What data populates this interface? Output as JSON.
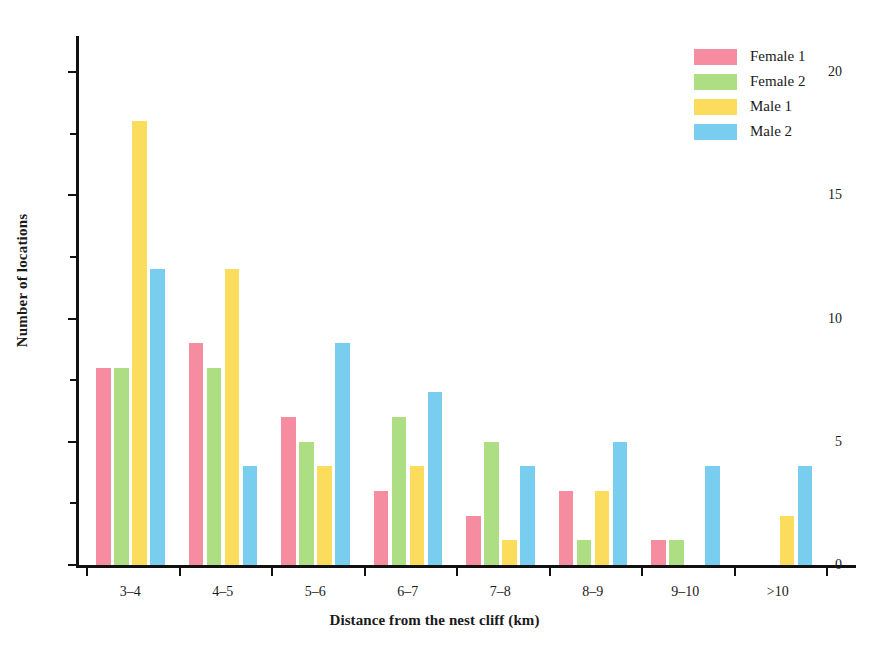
{
  "chart_data": {
    "type": "bar",
    "title": "",
    "xlabel": "Distance from the nest cliff (km)",
    "ylabel": "Number of locations",
    "categories": [
      "3–4",
      "4–5",
      "5–6",
      "6–7",
      "7–8",
      "8–9",
      "9–10",
      ">10"
    ],
    "series": [
      {
        "name": "Female 1",
        "color": "#f58ca0",
        "values": [
          8,
          9,
          6,
          3,
          2,
          3,
          1,
          0
        ]
      },
      {
        "name": "Female 2",
        "color": "#aede84",
        "values": [
          8,
          8,
          5,
          6,
          5,
          1,
          1,
          0
        ]
      },
      {
        "name": "Male 1",
        "color": "#fcdc5c",
        "values": [
          18,
          12,
          4,
          4,
          1,
          3,
          0,
          2
        ]
      },
      {
        "name": "Male 2",
        "color": "#79cdef",
        "values": [
          12,
          4,
          9,
          7,
          4,
          5,
          4,
          4
        ]
      }
    ],
    "ylim": [
      0,
      20
    ],
    "y_ticks": [
      0,
      5,
      10,
      15,
      20
    ],
    "y_tick_labels": [
      "0",
      "5",
      "10",
      "15",
      "20"
    ],
    "y_minor_ticks": [
      2.5,
      7.5,
      12.5,
      17.5
    ],
    "grid": false,
    "legend_position": "top-right"
  }
}
